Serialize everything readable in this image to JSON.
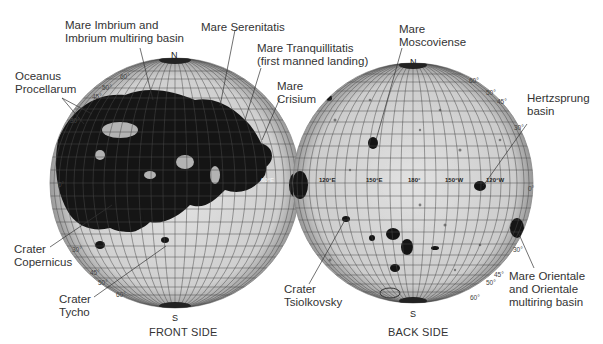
{
  "figure": {
    "globes": {
      "front": {
        "caption": "FRONT SIDE",
        "north": "N",
        "south": "S",
        "lat_labels_north": [
          "60°",
          "50°",
          "45°",
          "30°"
        ],
        "lat_labels_equator": "0°",
        "lat_labels_south": [
          "30°",
          "45°",
          "50°",
          "60°"
        ],
        "equator_lon_label": "60°E"
      },
      "back": {
        "caption": "BACK SIDE",
        "north": "N",
        "south": "S",
        "lat_labels_north": [
          "60°",
          "50°",
          "45°",
          "30°"
        ],
        "lat_labels_equator": "0°",
        "lat_labels_south": [
          "30°",
          "45°",
          "50°",
          "60°"
        ],
        "equator_lon_labels": [
          "120°E",
          "150°E",
          "180°",
          "150°W",
          "120°W"
        ]
      }
    },
    "callouts": {
      "imbrium": "Mare Imbrium and",
      "imbrium_2": "Imbrium multiring basin",
      "procellarum": "Oceanus",
      "procellarum_2": "Procellarum",
      "serenitatis": "Mare Serenitatis",
      "tranquillitatis": "Mare  Tranquillitatis",
      "tranquillitatis_2": "(first manned landing)",
      "crisium": "Mare",
      "crisium_2": "Crisium",
      "copernicus": "Crater",
      "copernicus_2": "Copernicus",
      "tycho": "Crater",
      "tycho_2": "Tycho",
      "moscoviense": "Mare",
      "moscoviense_2": "Moscoviense",
      "hertzsprung": "Hertzsprung",
      "hertzsprung_2": "basin",
      "tsiolkovsky": "Crater",
      "tsiolkovsky_2": "Tsiolkovsky",
      "orientale": "Mare  Orientale",
      "orientale_2": "and  Orientale",
      "orientale_3": "multiring  basin"
    },
    "colors": {
      "maria": "#141414",
      "highlands": "#d9d9d9",
      "grid": "#4a4a4a",
      "text": "#333333"
    }
  }
}
